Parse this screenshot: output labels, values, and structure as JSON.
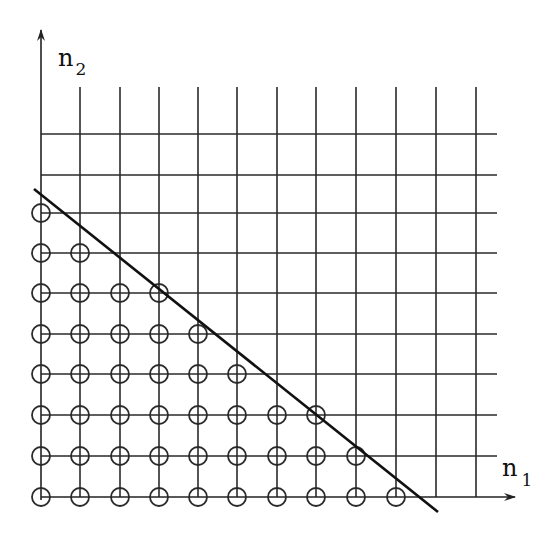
{
  "diagram": {
    "type": "lattice-region",
    "axes": {
      "x_label": "n",
      "x_subscript": "1",
      "y_label": "n",
      "y_subscript": "2"
    },
    "grid": {
      "columns": 12,
      "rows": 10
    },
    "boundary_line": "diagonal line separating included lattice points (circled) from the rest",
    "circled_points_per_row_from_bottom": [
      10,
      9,
      8,
      6,
      5,
      4,
      2,
      1
    ]
  }
}
